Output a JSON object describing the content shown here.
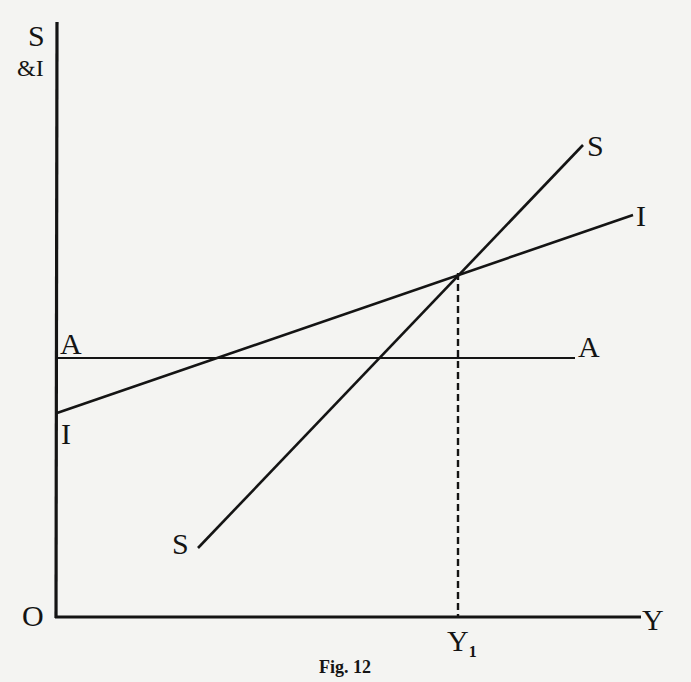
{
  "figure": {
    "caption": "Fig. 12",
    "y_axis_label_top": "S",
    "y_axis_label_bottom": "&I",
    "origin_label": "O",
    "x_axis_label": "Y",
    "equilibrium_income_label": "Y",
    "equilibrium_income_subscript": "1",
    "lines": {
      "savings": {
        "name": "S",
        "label_start": "S",
        "label_end": "S"
      },
      "investment": {
        "name": "I",
        "label_start": "I",
        "label_end": "I"
      },
      "autonomous": {
        "name": "A",
        "label_start": "A",
        "label_end": "A"
      }
    },
    "colors": {
      "ink": "#141414",
      "paper": "#f4f4f2"
    }
  }
}
